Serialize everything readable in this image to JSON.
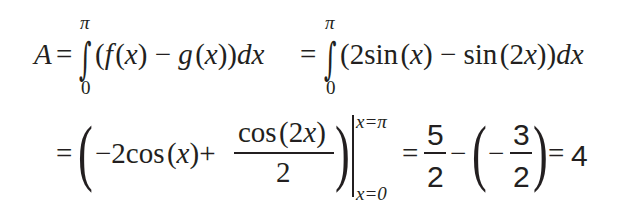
{
  "equation": {
    "line1": {
      "lhs": "A",
      "eq1": "=",
      "integral1": {
        "symbol": "∫",
        "upper": "π",
        "lower": "0",
        "integrand": "(f(x) − g(x))",
        "differential": "dx"
      },
      "eq2": "=",
      "integral2": {
        "symbol": "∫",
        "upper": "π",
        "lower": "0",
        "integrand": "(2sin(x) − sin(2x))",
        "differential": "dx"
      }
    },
    "line2": {
      "eq": "=",
      "antiderivative": {
        "term1": "−2cos(x)",
        "plus": "+",
        "fraction": {
          "numerator": "cos(2x)",
          "denominator": "2"
        }
      },
      "evaluation": {
        "upper": "x=π",
        "lower": "x=0"
      },
      "eq2": "=",
      "result_frac1": {
        "numerator": "5",
        "denominator": "2"
      },
      "minus": "−",
      "result_frac2": {
        "sign": "−",
        "numerator": "3",
        "denominator": "2"
      },
      "eq3": "=",
      "final": "4"
    }
  }
}
